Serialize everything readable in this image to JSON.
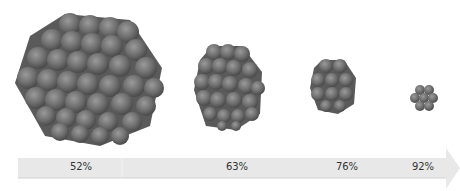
{
  "diagram": {
    "clusters": [
      {
        "id": "cluster-1",
        "size": "large",
        "surface_fraction": "52%"
      },
      {
        "id": "cluster-2",
        "size": "medium",
        "surface_fraction": "63%"
      },
      {
        "id": "cluster-3",
        "size": "small",
        "surface_fraction": "76%"
      },
      {
        "id": "cluster-4",
        "size": "smallest",
        "surface_fraction": "92%"
      }
    ],
    "arrow": {
      "direction": "right",
      "color": "#e6e6e6"
    },
    "sphere_color": "#6e6e6e"
  }
}
